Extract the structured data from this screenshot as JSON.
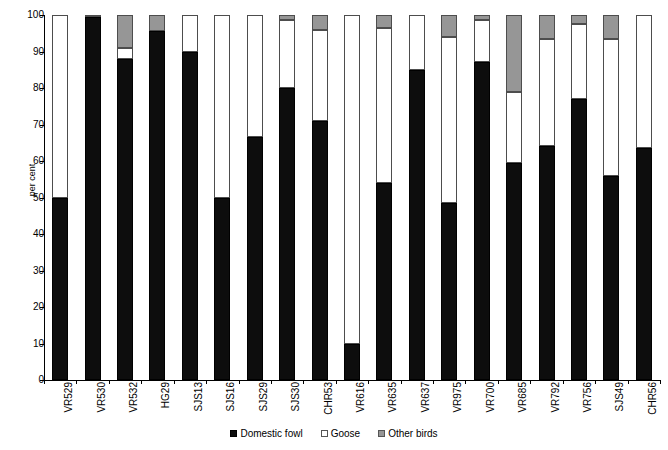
{
  "chart_data": {
    "type": "bar",
    "subtype": "stacked-percentage-column",
    "title": "",
    "subtitle": "",
    "xlabel": "",
    "ylabel": "per cent",
    "ylim": [
      0,
      100
    ],
    "y_ticks": [
      0,
      10,
      20,
      30,
      40,
      50,
      60,
      70,
      80,
      90,
      100
    ],
    "grid": false,
    "legend_position": "bottom-center",
    "categories": [
      "VR529",
      "VR530",
      "VR532",
      "HG29",
      "SJS13",
      "SJS16",
      "SJS29",
      "SJS30",
      "CHR53",
      "VR616",
      "VR635",
      "VR637",
      "VR975",
      "VR700",
      "VR685",
      "VR792",
      "VR756",
      "SJS49",
      "CHR56"
    ],
    "series": [
      {
        "name": "Domestic fowl",
        "color": "#0d0d0d",
        "values": [
          50.0,
          99.5,
          88.0,
          95.5,
          90.0,
          50.0,
          66.5,
          80.0,
          71.0,
          10.0,
          54.0,
          85.0,
          48.5,
          87.0,
          59.5,
          64.0,
          77.0,
          56.0,
          63.5
        ]
      },
      {
        "name": "Goose",
        "color": "#ffffff",
        "values": [
          50.0,
          0.5,
          3.0,
          0.0,
          10.0,
          50.0,
          33.5,
          18.5,
          25.0,
          90.0,
          42.5,
          15.0,
          45.5,
          11.5,
          19.5,
          29.5,
          20.5,
          37.5,
          36.5
        ]
      },
      {
        "name": "Other birds",
        "color": "#969696",
        "values": [
          0.0,
          0.0,
          9.0,
          4.5,
          0.0,
          0.0,
          0.0,
          1.5,
          4.0,
          0.0,
          3.5,
          0.0,
          6.0,
          1.5,
          21.0,
          6.5,
          2.5,
          6.5,
          0.0
        ]
      }
    ]
  },
  "legend": {
    "items": [
      {
        "label": "Domestic fowl",
        "swatch": "domestic"
      },
      {
        "label": "Goose",
        "swatch": "goose"
      },
      {
        "label": "Other birds",
        "swatch": "other"
      }
    ]
  },
  "colors": {
    "domestic_fowl": "#0d0d0d",
    "goose": "#ffffff",
    "other_birds": "#969696",
    "axis": "#000000",
    "background": "#ffffff"
  }
}
